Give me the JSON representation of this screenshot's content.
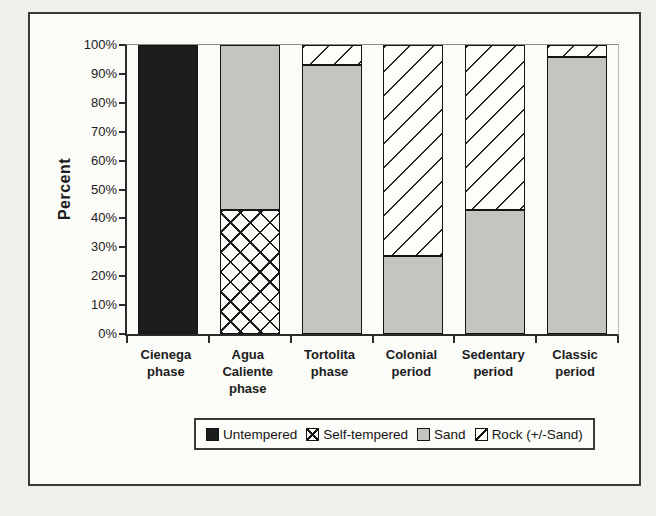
{
  "figure": {
    "page_background": "#f0efec",
    "frame_border_color": "#3a3a3a"
  },
  "chart_data": {
    "type": "bar",
    "stacked": true,
    "title": "",
    "xlabel": "",
    "ylabel": "Percent",
    "ylim": [
      0,
      100
    ],
    "grid": false,
    "ytick_labels": [
      "0%",
      "10%",
      "20%",
      "30%",
      "40%",
      "50%",
      "60%",
      "70%",
      "80%",
      "90%",
      "100%"
    ],
    "categories": [
      "Cienega phase",
      "Agua Caliente phase",
      "Tortolita phase",
      "Colonial period",
      "Sedentary period",
      "Classic period"
    ],
    "series": [
      {
        "name": "Untempered",
        "pattern": "untempered",
        "values": [
          100,
          0,
          0,
          0,
          0,
          0
        ]
      },
      {
        "name": "Self-tempered",
        "pattern": "self-tempered",
        "values": [
          0,
          43,
          0,
          0,
          0,
          0
        ]
      },
      {
        "name": "Sand",
        "pattern": "sand",
        "values": [
          0,
          57,
          93,
          27,
          43,
          96
        ]
      },
      {
        "name": "Rock (+/-Sand)",
        "pattern": "rock",
        "values": [
          0,
          0,
          7,
          73,
          57,
          4
        ]
      }
    ],
    "legend": {
      "position": "bottom",
      "entries": [
        "Untempered",
        "Self-tempered",
        "Sand",
        "Rock (+/-Sand)"
      ]
    },
    "colors": {
      "untempered_fill": "#1d1d1d",
      "sand_fill": "#c5c4bf",
      "hatch_line": "#1c1c1c",
      "hatch_background": "#fdfdfa"
    }
  }
}
